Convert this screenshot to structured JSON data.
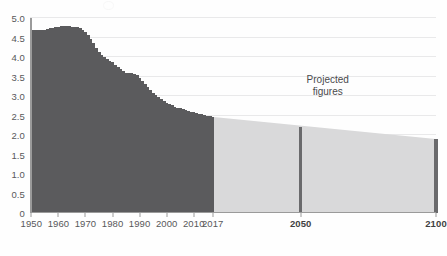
{
  "chart_data": {
    "type": "bar",
    "title": "",
    "subtitle": "",
    "xlabel": "",
    "ylabel": "",
    "ylim": [
      0,
      5.0
    ],
    "xlim": [
      1950,
      2100
    ],
    "grid": true,
    "legend_position": "none",
    "y_ticks": [
      "0",
      "0.5",
      "1.0",
      "1.5",
      "2.0",
      "2.5",
      "3.0",
      "3.5",
      "4.0",
      "4.5",
      "5.0"
    ],
    "y_tick_values": [
      0,
      0.5,
      1.0,
      1.5,
      2.0,
      2.5,
      3.0,
      3.5,
      4.0,
      4.5,
      5.0
    ],
    "x_ticks": [
      "1950",
      "1960",
      "1970",
      "1980",
      "1990",
      "2000",
      "2010",
      "2017",
      "2050",
      "2100"
    ],
    "x_tick_values": [
      1950,
      1960,
      1970,
      1980,
      1990,
      2000,
      2010,
      2017,
      2050,
      2100
    ],
    "x_ticks_bold": [
      "2050",
      "2100"
    ],
    "annotations": [
      {
        "text_line1": "Projected",
        "text_line2": "figures",
        "x": 2060,
        "y": 2.95
      }
    ],
    "series": [
      {
        "name": "Historical",
        "color": "#5b5b5d",
        "x": [
          1950,
          1951,
          1952,
          1953,
          1954,
          1955,
          1956,
          1957,
          1958,
          1959,
          1960,
          1961,
          1962,
          1963,
          1964,
          1965,
          1966,
          1967,
          1968,
          1969,
          1970,
          1971,
          1972,
          1973,
          1974,
          1975,
          1976,
          1977,
          1978,
          1979,
          1980,
          1981,
          1982,
          1983,
          1984,
          1985,
          1986,
          1987,
          1988,
          1989,
          1990,
          1991,
          1992,
          1993,
          1994,
          1995,
          1996,
          1997,
          1998,
          1999,
          2000,
          2001,
          2002,
          2003,
          2004,
          2005,
          2006,
          2007,
          2008,
          2009,
          2010,
          2011,
          2012,
          2013,
          2014,
          2015,
          2016,
          2017
        ],
        "values": [
          4.7,
          4.7,
          4.7,
          4.69,
          4.69,
          4.7,
          4.72,
          4.74,
          4.75,
          4.76,
          4.78,
          4.79,
          4.8,
          4.8,
          4.79,
          4.78,
          4.77,
          4.76,
          4.74,
          4.7,
          4.64,
          4.56,
          4.46,
          4.35,
          4.24,
          4.13,
          4.05,
          3.99,
          3.95,
          3.91,
          3.86,
          3.8,
          3.74,
          3.68,
          3.63,
          3.59,
          3.58,
          3.58,
          3.57,
          3.53,
          3.46,
          3.38,
          3.3,
          3.23,
          3.16,
          3.09,
          3.03,
          2.97,
          2.92,
          2.87,
          2.83,
          2.79,
          2.76,
          2.73,
          2.7,
          2.68,
          2.66,
          2.64,
          2.62,
          2.6,
          2.59,
          2.57,
          2.55,
          2.53,
          2.51,
          2.5,
          2.48,
          2.47
        ]
      },
      {
        "name": "Projected",
        "color": "#6a6a6c",
        "band_color": "#d9d9da",
        "x": [
          2050,
          2100
        ],
        "values": [
          2.2,
          1.9
        ]
      }
    ],
    "projection_start_year": 2017,
    "projection_band": {
      "start_year": 2017,
      "end_year": 2100,
      "start_value": 2.47,
      "end_value": 1.9,
      "fill_color": "#d9d9da"
    }
  },
  "colors": {
    "bar": "#5b5b5d",
    "projected_bar": "#6a6a6c",
    "projected_band": "#d9d9da",
    "gridline": "#e9e9ea",
    "axis": "#9a9a9a",
    "tick_text": "#58585a",
    "background": "#fefefe"
  }
}
